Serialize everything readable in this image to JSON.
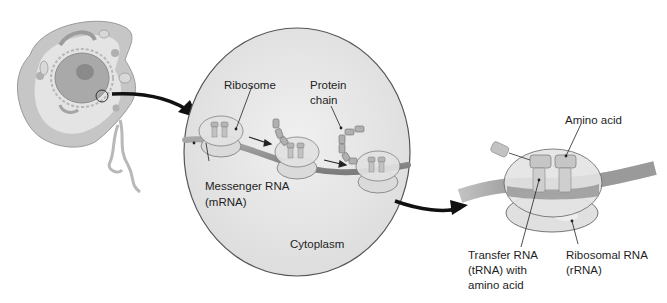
{
  "diagram": {
    "panels": [
      {
        "name": "cell",
        "description": "Eukaryotic cell with nucleus; circled region magnified"
      },
      {
        "name": "cytoplasm-zoom",
        "description": "Magnified view of ribosomes translating mRNA"
      },
      {
        "name": "ribosome-detail",
        "description": "Single ribosome with tRNA and amino acids"
      }
    ],
    "labels": {
      "ribosome": "Ribosome",
      "protein_chain_1": "Protein",
      "protein_chain_2": "chain",
      "mrna_1": "Messenger RNA",
      "mrna_2": "(mRNA)",
      "cytoplasm": "Cytoplasm",
      "amino_acid": "Amino acid",
      "trna_1": "Transfer RNA",
      "trna_2": "(tRNA) with",
      "trna_3": "amino acid",
      "rrna_1": "Ribosomal RNA",
      "rrna_2": "(rRNA)"
    },
    "colors": {
      "background": "#ffffff",
      "cell_body": "#c9c9c9",
      "cytoplasm_fill": "#e6e6e6",
      "outline": "#555555",
      "arrow": "#111111",
      "mrna_strand": "#8a8a8a",
      "ribosome": "#d4d4d4"
    }
  }
}
